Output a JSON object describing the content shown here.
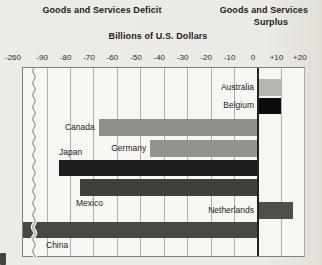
{
  "header": {
    "deficit_title": "Goods and Services Deficit",
    "surplus_title_line1": "Goods and Services",
    "surplus_title_line2": "Surplus",
    "axis_title": "Billions of U.S. Dollars"
  },
  "chart_data": {
    "type": "bar",
    "orientation": "horizontal",
    "xlabel": "Billions of U.S. Dollars",
    "unit": "billions of U.S. dollars",
    "axis": {
      "tick_labels": [
        "-260",
        "-90",
        "-80",
        "-70",
        "-60",
        "-50",
        "-40",
        "-30",
        "-20",
        "-10",
        "0",
        "+10",
        "+20"
      ],
      "tick_values": [
        -260,
        -90,
        -80,
        -70,
        -60,
        -50,
        -40,
        -30,
        -20,
        -10,
        0,
        10,
        20
      ],
      "broken_axis": true,
      "break_between": [
        -260,
        -90
      ],
      "gridlines": true,
      "xlim": [
        -260,
        20
      ]
    },
    "bars": [
      {
        "country": "Australia",
        "value": 10,
        "color": "#b6b5b2",
        "label_pos": "axis-left"
      },
      {
        "country": "Belgium",
        "value": 10,
        "color": "#0c0c0a",
        "label_pos": "axis-left"
      },
      {
        "country": "Canada",
        "value": -68,
        "color": "#8e8e8b",
        "label_pos": "bar-left"
      },
      {
        "country": "Germany",
        "value": -46,
        "color": "#93928f",
        "label_pos": "bar-left"
      },
      {
        "country": "Japan",
        "value": -85,
        "color": "#1d1d1b",
        "label_pos": "above"
      },
      {
        "country": "Mexico",
        "value": -76,
        "color": "#3f3f3c",
        "label_pos": "below"
      },
      {
        "country": "Netherlands",
        "value": 15,
        "color": "#4e4e4b",
        "label_pos": "axis-left"
      },
      {
        "country": "China",
        "value": -256,
        "color": "#474744",
        "label_pos": "below"
      }
    ]
  }
}
